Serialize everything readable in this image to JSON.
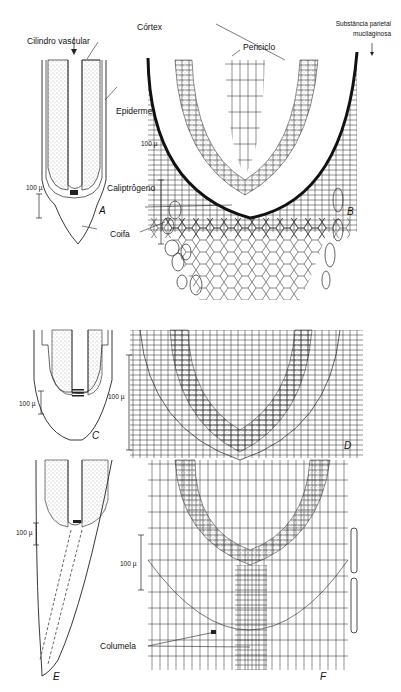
{
  "figure": {
    "labels": {
      "cilindro_vascular": "Cilindro vascular",
      "cortex": "Córtex",
      "periciclo": "Periciclo",
      "substancia_line1": "Substância parietal",
      "substancia_line2": "mucilaginosa",
      "epiderme": "Epiderme",
      "caliptrogeno": "Caliptrôgeno",
      "coifa": "Coifa",
      "columela": "Columela"
    },
    "scale_bars": {
      "a": "100 µ",
      "b": "100 µ",
      "c": "100 µ",
      "d": "100 µ",
      "e": "100 µ",
      "f": "100 µ"
    },
    "panels": {
      "a": "A",
      "b": "B",
      "c": "C",
      "d": "D",
      "e": "E",
      "f": "F"
    },
    "colors": {
      "ink": "#1a1a1a",
      "paper": "#ffffff",
      "stipple": "#6a6a6a"
    }
  }
}
